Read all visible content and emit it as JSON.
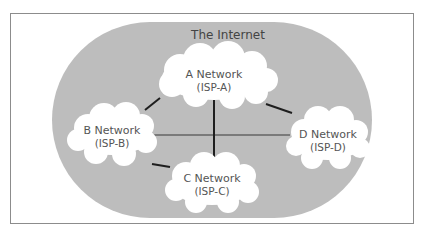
{
  "title": "The Internet",
  "colors": {
    "frame": "#8c8c8c",
    "internet_fill": "#bdbdbd",
    "cloud_fill": "#ffffff",
    "link_dark": "#1e1e1e",
    "link_gray": "#7a7a7a",
    "text": "#555555"
  },
  "networks": [
    {
      "id": "A",
      "name": "A Network",
      "isp": "(ISP-A)"
    },
    {
      "id": "B",
      "name": "B Network",
      "isp": "(ISP-B)"
    },
    {
      "id": "C",
      "name": "C Network",
      "isp": "(ISP-C)"
    },
    {
      "id": "D",
      "name": "D Network",
      "isp": "(ISP-D)"
    }
  ],
  "links": [
    {
      "from": "A",
      "to": "B",
      "style": "dark"
    },
    {
      "from": "A",
      "to": "D",
      "style": "dark"
    },
    {
      "from": "A",
      "to": "C",
      "style": "dark"
    },
    {
      "from": "B",
      "to": "C",
      "style": "dark"
    },
    {
      "from": "B",
      "to": "D",
      "style": "gray"
    }
  ]
}
